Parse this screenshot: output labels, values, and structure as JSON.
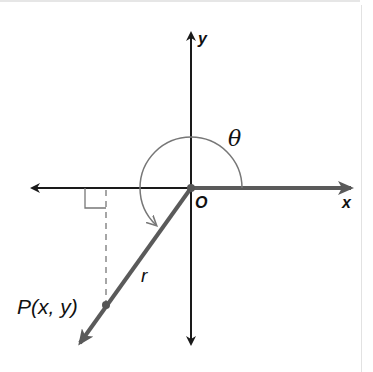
{
  "diagram": {
    "labels": {
      "y_axis": "y",
      "x_axis": "x",
      "origin": "O",
      "angle": "θ",
      "radius": "r",
      "point": "P(x, y)"
    },
    "colors": {
      "axis": "#1a1a1a",
      "positive_x_ray": "#5a5a5a",
      "terminal_ray": "#5a5a5a",
      "arc": "#777777",
      "dashed": "#777777",
      "right_angle": "#777777",
      "text": "#111111"
    },
    "geometry": {
      "origin": [
        191,
        188
      ],
      "x_axis_range": [
        30,
        353
      ],
      "y_axis_range": [
        32,
        345
      ],
      "arc_radius": 51,
      "terminal_end": [
        78,
        346
      ],
      "point_P": [
        106,
        305
      ],
      "angle_quadrant": "III"
    }
  }
}
